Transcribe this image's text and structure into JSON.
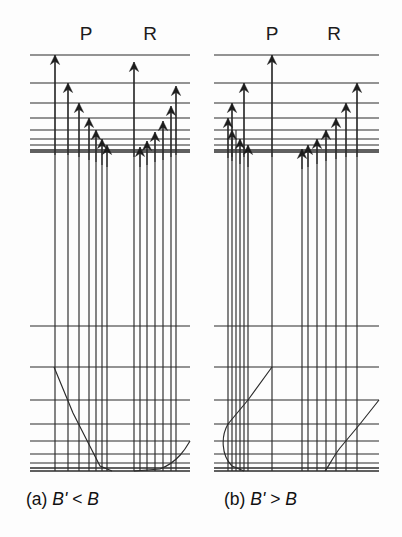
{
  "figure": {
    "background_color": "#fdfdfd",
    "line_color": "#2b2b2b",
    "text_color": "#111111",
    "width": 402,
    "height": 537
  },
  "panels": [
    {
      "id": "panel-a",
      "caption_prefix": "(a)",
      "caption_expr_left": "B'",
      "caption_relation": "<",
      "caption_expr_right": "B",
      "caption_full": "(a) B' < B",
      "caption_x": 26,
      "caption_y": 505,
      "origin_x": 0,
      "branch_labels": [
        {
          "name": "P",
          "text": "P",
          "x": 86,
          "y": 40
        },
        {
          "name": "R",
          "text": "R",
          "x": 150,
          "y": 40
        }
      ],
      "upper_levels_x1": 30,
      "upper_levels_x2": 190,
      "upper_levels_y": [
        55,
        83,
        103,
        118,
        130,
        139,
        145,
        150,
        152
      ],
      "lower_levels_x1": 30,
      "lower_levels_x2": 190,
      "lower_levels_y": [
        326,
        367,
        400,
        424,
        441,
        454,
        463,
        468,
        471
      ],
      "p_arrows": [
        {
          "x": 55,
          "top": 55,
          "bottom": 155
        },
        {
          "x": 68,
          "top": 83,
          "bottom": 155
        },
        {
          "x": 79,
          "top": 103,
          "bottom": 157
        },
        {
          "x": 89,
          "top": 118,
          "bottom": 160
        },
        {
          "x": 96,
          "top": 130,
          "bottom": 162
        },
        {
          "x": 102,
          "top": 139,
          "bottom": 165
        },
        {
          "x": 107,
          "top": 145,
          "bottom": 167
        }
      ],
      "r_arrows": [
        {
          "x": 134,
          "top": 62,
          "bottom": 157
        },
        {
          "x": 176,
          "top": 86,
          "bottom": 155
        },
        {
          "x": 171,
          "top": 106,
          "bottom": 157
        },
        {
          "x": 163,
          "top": 121,
          "bottom": 160
        },
        {
          "x": 155,
          "top": 132,
          "bottom": 162
        },
        {
          "x": 147,
          "top": 141,
          "bottom": 165
        },
        {
          "x": 140,
          "top": 147,
          "bottom": 167
        }
      ],
      "drop_lines": [
        {
          "x": 55,
          "y1": 55,
          "y2": 471
        },
        {
          "x": 68,
          "y1": 83,
          "y2": 471
        },
        {
          "x": 79,
          "y1": 103,
          "y2": 471
        },
        {
          "x": 89,
          "y1": 118,
          "y2": 471
        },
        {
          "x": 96,
          "y1": 130,
          "y2": 471
        },
        {
          "x": 102,
          "y1": 139,
          "y2": 471
        },
        {
          "x": 107,
          "y1": 145,
          "y2": 471
        },
        {
          "x": 134,
          "y1": 62,
          "y2": 471
        },
        {
          "x": 140,
          "y1": 147,
          "y2": 471
        },
        {
          "x": 147,
          "y1": 141,
          "y2": 471
        },
        {
          "x": 155,
          "y1": 132,
          "y2": 471
        },
        {
          "x": 163,
          "y1": 121,
          "y2": 471
        },
        {
          "x": 171,
          "y1": 106,
          "y2": 471
        },
        {
          "x": 176,
          "y1": 86,
          "y2": 471
        }
      ],
      "fortrat_curve": "M 54,367 L 73,413 L 100,466 L 112,471",
      "fortrat_curve2": "M 190,441 C 186,448 178,462 160,469 L 134,471",
      "curve_direction": "p-branch-descends-left, r-branch-head-forms-right"
    },
    {
      "id": "panel-b",
      "caption_prefix": "(b)",
      "caption_expr_left": "B'",
      "caption_relation": ">",
      "caption_expr_right": "B",
      "caption_full": "(b) B' > B",
      "caption_x": 224,
      "caption_y": 505,
      "origin_x": 201,
      "branch_labels": [
        {
          "name": "P",
          "text": "P",
          "x": 272,
          "y": 40
        },
        {
          "name": "R",
          "text": "R",
          "x": 334,
          "y": 40
        }
      ],
      "upper_levels_x1": 214,
      "upper_levels_x2": 379,
      "upper_levels_y": [
        55,
        83,
        103,
        118,
        130,
        139,
        145,
        150,
        152
      ],
      "lower_levels_x1": 214,
      "lower_levels_x2": 379,
      "lower_levels_y": [
        326,
        367,
        400,
        424,
        441,
        454,
        463,
        468,
        471
      ],
      "p_arrows": [
        {
          "x": 272,
          "top": 55,
          "bottom": 157
        },
        {
          "x": 244,
          "top": 83,
          "bottom": 157
        },
        {
          "x": 232,
          "top": 103,
          "bottom": 157
        },
        {
          "x": 228,
          "top": 118,
          "bottom": 158
        },
        {
          "x": 232,
          "top": 130,
          "bottom": 161
        },
        {
          "x": 240,
          "top": 139,
          "bottom": 164
        },
        {
          "x": 248,
          "top": 145,
          "bottom": 167
        }
      ],
      "r_arrows": [
        {
          "x": 357,
          "top": 83,
          "bottom": 157
        },
        {
          "x": 346,
          "top": 103,
          "bottom": 157
        },
        {
          "x": 336,
          "top": 118,
          "bottom": 159
        },
        {
          "x": 326,
          "top": 130,
          "bottom": 161
        },
        {
          "x": 317,
          "top": 139,
          "bottom": 164
        },
        {
          "x": 308,
          "top": 145,
          "bottom": 167
        },
        {
          "x": 302,
          "top": 149,
          "bottom": 169
        }
      ],
      "drop_lines": [
        {
          "x": 272,
          "y1": 55,
          "y2": 471
        },
        {
          "x": 244,
          "y1": 83,
          "y2": 471
        },
        {
          "x": 232,
          "y1": 103,
          "y2": 471
        },
        {
          "x": 228,
          "y1": 118,
          "y2": 471
        },
        {
          "x": 236,
          "y1": 130,
          "y2": 471
        },
        {
          "x": 240,
          "y1": 139,
          "y2": 471
        },
        {
          "x": 248,
          "y1": 145,
          "y2": 471
        },
        {
          "x": 357,
          "y1": 83,
          "y2": 471
        },
        {
          "x": 346,
          "y1": 103,
          "y2": 471
        },
        {
          "x": 336,
          "y1": 118,
          "y2": 471
        },
        {
          "x": 326,
          "y1": 130,
          "y2": 471
        },
        {
          "x": 317,
          "y1": 139,
          "y2": 471
        },
        {
          "x": 308,
          "y1": 145,
          "y2": 471
        },
        {
          "x": 302,
          "y1": 149,
          "y2": 471
        }
      ],
      "fortrat_curve": "M 272,367 L 248,400 L 228,424 C 221,436 221,455 232,466 L 244,471",
      "fortrat_curve2": "M 379,400 L 360,424 L 340,448 C 333,457 329,466 325,471",
      "curve_direction": "p-branch-head-forms-left, r-branch-ascends-right"
    }
  ],
  "geometry": {
    "arrow_head_half_width": 4.6,
    "arrow_head_length": 9.5,
    "level_line_stroke": 1.15,
    "arrow_stroke": 1.2
  }
}
